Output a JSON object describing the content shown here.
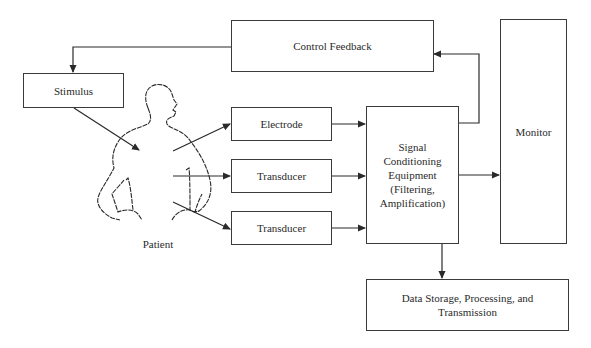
{
  "diagram": {
    "type": "block-diagram",
    "boxes": {
      "control_feedback": "Control Feedback",
      "stimulus": "Stimulus",
      "electrode": "Electrode",
      "transducer_1": "Transducer",
      "transducer_2": "Transducer",
      "signal_conditioning": "Signal Conditioning Equipment (Filtering, Amplification)",
      "monitor": "Monitor",
      "data_storage": "Data Storage, Processing, and Transmission"
    },
    "patient_label": "Patient",
    "edges": [
      {
        "from": "control_feedback",
        "to": "stimulus"
      },
      {
        "from": "stimulus",
        "to": "patient"
      },
      {
        "from": "patient",
        "to": "electrode"
      },
      {
        "from": "patient",
        "to": "transducer_1"
      },
      {
        "from": "patient",
        "to": "transducer_2"
      },
      {
        "from": "electrode",
        "to": "signal_conditioning"
      },
      {
        "from": "transducer_1",
        "to": "signal_conditioning"
      },
      {
        "from": "transducer_2",
        "to": "signal_conditioning"
      },
      {
        "from": "signal_conditioning",
        "to": "control_feedback"
      },
      {
        "from": "signal_conditioning",
        "to": "monitor"
      },
      {
        "from": "signal_conditioning",
        "to": "data_storage"
      }
    ],
    "colors": {
      "stroke": "#3a3a3a",
      "background": "#ffffff",
      "text": "#2a2a2a"
    }
  }
}
